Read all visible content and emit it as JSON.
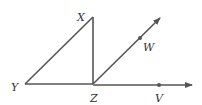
{
  "diagram": {
    "type": "geometry",
    "stroke_color": "#555555",
    "points": {
      "X": {
        "label": "X",
        "x": 93,
        "y": 17
      },
      "Y": {
        "label": "Y",
        "x": 25,
        "y": 84
      },
      "Z": {
        "label": "Z",
        "x": 93,
        "y": 84
      },
      "W": {
        "label": "W",
        "x": 140,
        "y": 38
      },
      "V": {
        "label": "V",
        "x": 159,
        "y": 85
      }
    },
    "segments": [
      {
        "from": "Y",
        "to": "X"
      },
      {
        "from": "X",
        "to": "Z"
      },
      {
        "from": "Y",
        "to": "Z"
      }
    ],
    "rays": [
      {
        "from": "Z",
        "through": "W"
      },
      {
        "from": "Z",
        "through": "V"
      }
    ]
  }
}
